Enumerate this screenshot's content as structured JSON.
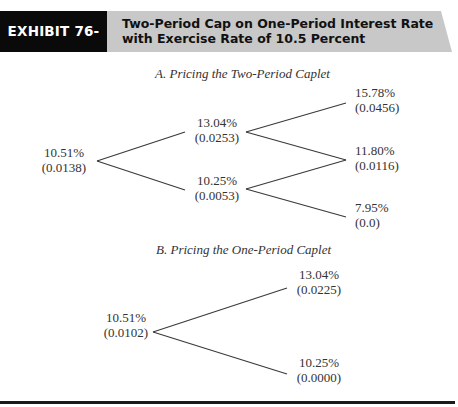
{
  "header": {
    "exhibit_label": "EXHIBIT 76-22",
    "title_line1": "Two-Period Cap on One-Period Interest Rate",
    "title_line2": "with Exercise Rate of 10.5 Percent",
    "colors": {
      "label_bg": "#0a0a0a",
      "title_bg": "#c8c8c8"
    }
  },
  "section_a": {
    "title": "A. Pricing the Two-Period Caplet",
    "nodes": {
      "root": {
        "rate": "10.51%",
        "value": "(0.0138)"
      },
      "up": {
        "rate": "13.04%",
        "value": "(0.0253)"
      },
      "down": {
        "rate": "10.25%",
        "value": "(0.0053)"
      },
      "up_up": {
        "rate": "15.78%",
        "value": "(0.0456)"
      },
      "up_down": {
        "rate": "11.80%",
        "value": "(0.0116)"
      },
      "down_down": {
        "rate": "7.95%",
        "value": "(0.0)"
      }
    }
  },
  "section_b": {
    "title": "B. Pricing the One-Period Caplet",
    "nodes": {
      "root": {
        "rate": "10.51%",
        "value": "(0.0102)"
      },
      "up": {
        "rate": "13.04%",
        "value": "(0.0225)"
      },
      "down": {
        "rate": "10.25%",
        "value": "(0.0000)"
      }
    }
  }
}
